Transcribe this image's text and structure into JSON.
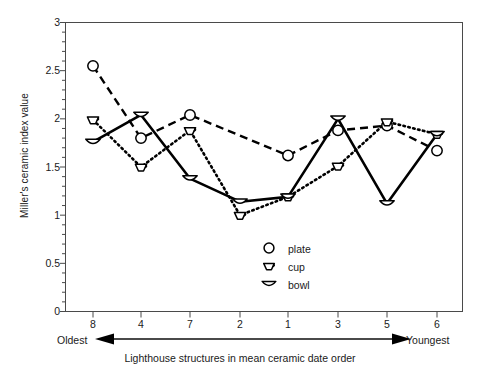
{
  "chart_data": {
    "type": "line",
    "title": "",
    "xlabel": "Lighthouse structures in mean ceramic date order",
    "ylabel": "Miller's ceramic index value",
    "categories": [
      "8",
      "4",
      "7",
      "2",
      "1",
      "3",
      "5",
      "6"
    ],
    "xtick_labels": [
      "8",
      "4",
      "7",
      "2",
      "1",
      "3",
      "5",
      "6"
    ],
    "ytick_labels": [
      "0",
      "0.5",
      "1",
      "1.5",
      "2",
      "2.5",
      "3"
    ],
    "ylim": [
      0,
      3
    ],
    "ytick_step": 0.5,
    "yminor_step": 0.1,
    "grid": false,
    "legend_position": "inside-lower-right",
    "axis_left_end_label": "Oldest",
    "axis_right_end_label": "Youngest",
    "series": [
      {
        "name": "plate",
        "marker": "circle",
        "linestyle": "dashed",
        "x": [
          "8",
          "4",
          "7",
          "1",
          "3",
          "5",
          "6"
        ],
        "values": [
          2.55,
          1.8,
          2.04,
          1.62,
          1.88,
          1.93,
          1.67
        ]
      },
      {
        "name": "cup",
        "marker": "cup",
        "linestyle": "dotted",
        "x": [
          "8",
          "4",
          "7",
          "2",
          "1",
          "3",
          "5",
          "6"
        ],
        "values": [
          1.99,
          1.5,
          1.88,
          1.0,
          1.19,
          1.51,
          1.97,
          1.84
        ]
      },
      {
        "name": "bowl",
        "marker": "bowl",
        "linestyle": "solid",
        "x": [
          "8",
          "4",
          "7",
          "2",
          "1",
          "3",
          "5",
          "6"
        ],
        "values": [
          1.76,
          2.04,
          1.38,
          1.14,
          1.19,
          2.0,
          1.12,
          1.84
        ]
      }
    ],
    "legend": [
      {
        "label": "plate",
        "marker": "circle"
      },
      {
        "label": "cup",
        "marker": "cup"
      },
      {
        "label": "bowl",
        "marker": "bowl"
      }
    ],
    "colors": {
      "line": "#000000",
      "axis": "#4a4a4a",
      "text": "#1a1a1a"
    }
  }
}
